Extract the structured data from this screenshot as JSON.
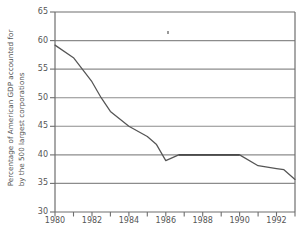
{
  "chart_data": {
    "type": "line",
    "title": "",
    "xlabel": "",
    "ylabel": "Percentage of American GDP accounted for by the 500 largest corporations",
    "ylabel_lines": [
      "Percentage of American GDP accounted for",
      "by the 500 largest corporations"
    ],
    "xlim": [
      1980,
      1993
    ],
    "ylim": [
      30,
      65
    ],
    "grid": true,
    "legend": "none",
    "yticks": [
      30,
      35,
      40,
      45,
      50,
      55,
      60,
      65
    ],
    "ytick_labels": [
      "30",
      "35",
      "40",
      "45",
      "50",
      "55",
      "60",
      "65"
    ],
    "xticks": [
      1980,
      1982,
      1984,
      1986,
      1988,
      1990,
      1992
    ],
    "xtick_labels": [
      "1980",
      "1982",
      "1984",
      "1986",
      "1988",
      "1990",
      "1992"
    ],
    "xminor_ticks": [
      1981,
      1983,
      1985,
      1987,
      1989,
      1991,
      1993
    ],
    "series": [
      {
        "name": "Percentage of American GDP",
        "color": "#555555",
        "x": [
          1980,
          1981,
          1982,
          1982.5,
          1983,
          1984,
          1985,
          1985.5,
          1986,
          1986.7,
          1990,
          1991,
          1992,
          1992.4,
          1993
        ],
        "values": [
          59.2,
          57.0,
          52.8,
          50.0,
          47.6,
          45.0,
          43.2,
          41.8,
          39.0,
          40.0,
          40.0,
          38.1,
          37.6,
          37.4,
          35.7
        ]
      }
    ]
  },
  "axes": {
    "ytick_color": "#555555",
    "xtick_color": "#555555",
    "grid_color": "#8c8c8c",
    "frame_color": "#6e6e6e",
    "line_color": "#555555"
  }
}
